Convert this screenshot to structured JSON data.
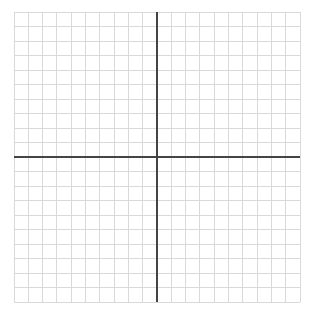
{
  "figure": {
    "title": "",
    "type": "blank-coordinate-grid",
    "canvas_width": 311,
    "canvas_height": 322,
    "background_color": "#ffffff"
  },
  "chart_data": {
    "type": "scatter",
    "title": "",
    "subtitle": "",
    "xlabel": "",
    "ylabel": "",
    "series": [
      {
        "name": "",
        "x": [],
        "y": []
      }
    ],
    "x": [],
    "values": [],
    "categories": [],
    "xlim": [
      -10,
      10
    ],
    "ylim": [
      -10,
      10
    ],
    "xticks": [
      -10,
      -9,
      -8,
      -7,
      -6,
      -5,
      -4,
      -3,
      -2,
      -1,
      0,
      1,
      2,
      3,
      4,
      5,
      6,
      7,
      8,
      9,
      10
    ],
    "yticks": [
      -10,
      -9,
      -8,
      -7,
      -6,
      -5,
      -4,
      -3,
      -2,
      -1,
      0,
      1,
      2,
      3,
      4,
      5,
      6,
      7,
      8,
      9,
      10
    ],
    "xtick_labels": [],
    "ytick_labels": [],
    "grid": true,
    "grid_columns": 20,
    "grid_rows": 20,
    "legend": false,
    "legend_position": "none",
    "annotations": [],
    "data_labels": []
  },
  "plot": {
    "left": 14,
    "top": 12,
    "right": 300,
    "bottom": 302,
    "cell_size": 14.3,
    "origin_x": 157,
    "origin_y": 157,
    "colors": {
      "grid_line": "#d9d9d9",
      "axis_line": "#444444",
      "background": "#ffffff"
    },
    "grid_line_width": 1,
    "axis_line_width": 1.6
  },
  "axes": {
    "x_axis_label": "",
    "y_axis_label": "",
    "x_axis_name": "x-axis",
    "y_axis_name": "y-axis"
  }
}
